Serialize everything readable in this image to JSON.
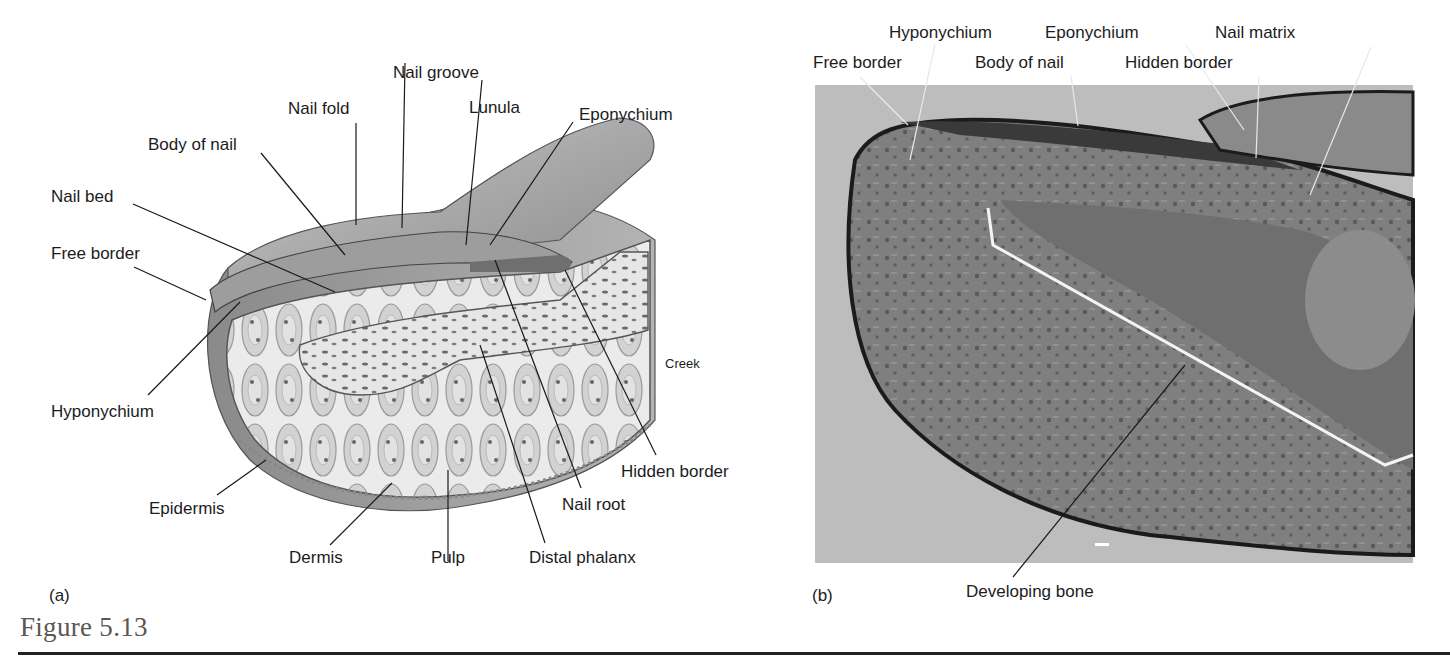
{
  "figure": {
    "title": "Figure 5.13",
    "rule_color": "#222222",
    "title_color": "#5d5752"
  },
  "panel_a": {
    "tag": "(a)",
    "type": "illustration",
    "subject": "nail-anatomy-sagittal-drawing",
    "labels": {
      "nail_groove": "Nail groove",
      "nail_fold": "Nail fold",
      "lunula": "Lunula",
      "eponychium": "Eponychium",
      "body_of_nail": "Body of nail",
      "nail_bed": "Nail bed",
      "free_border": "Free border",
      "hyponychium": "Hyponychium",
      "creek": "Creek",
      "hidden_border": "Hidden border",
      "epidermis": "Epidermis",
      "nail_root": "Nail root",
      "dermis": "Dermis",
      "pulp": "Pulp",
      "distal_phalanx": "Distal phalanx"
    }
  },
  "panel_b": {
    "tag": "(b)",
    "type": "micrograph",
    "subject": "nail-histology-section",
    "labels": {
      "hyponychium": "Hyponychium",
      "eponychium": "Eponychium",
      "nail_matrix": "Nail matrix",
      "free_border": "Free border",
      "body_of_nail": "Body of nail",
      "hidden_border": "Hidden border",
      "developing_bone": "Developing bone"
    },
    "background_color": "#bdbdbd",
    "tissue_color": "#7a7a7a"
  }
}
